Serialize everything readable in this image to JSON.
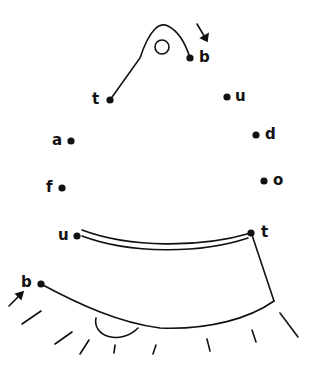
{
  "puzzle": {
    "type": "dot-to-dot",
    "ink_color": "#111111",
    "background": "#ffffff",
    "dots": [
      {
        "label": "t",
        "x": 110,
        "y": 100,
        "label_x": 92,
        "label_y": 92
      },
      {
        "label": "u",
        "x": 227,
        "y": 97,
        "label_x": 235,
        "label_y": 89
      },
      {
        "label": "a",
        "x": 71,
        "y": 141,
        "label_x": 52,
        "label_y": 133
      },
      {
        "label": "d",
        "x": 256,
        "y": 135,
        "label_x": 265,
        "label_y": 127
      },
      {
        "label": "f",
        "x": 62,
        "y": 188,
        "label_x": 46,
        "label_y": 180
      },
      {
        "label": "o",
        "x": 264,
        "y": 181,
        "label_x": 273,
        "label_y": 173
      },
      {
        "label": "u",
        "x": 77,
        "y": 236,
        "label_x": 58,
        "label_y": 228
      },
      {
        "label": "t",
        "x": 251,
        "y": 233,
        "label_x": 261,
        "label_y": 225
      },
      {
        "label": "b",
        "x": 41,
        "y": 284,
        "label_x": 21,
        "label_y": 275
      },
      {
        "label": "b",
        "x": 190,
        "y": 58,
        "label_x": 199,
        "label_y": 50
      }
    ]
  }
}
